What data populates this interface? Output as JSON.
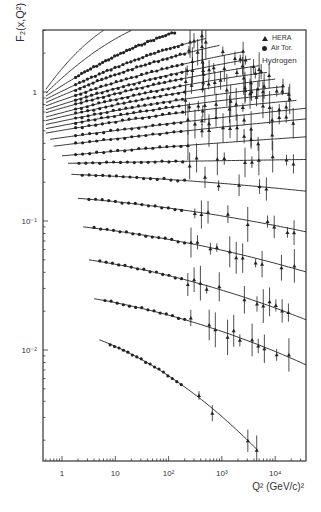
{
  "chart_data": {
    "type": "scatter",
    "title": "",
    "xlabel": "Q² (GeV/c)²",
    "ylabel": "F₂(x,Q²)",
    "xscale": "log",
    "yscale": "log",
    "xlim": [
      0.5,
      40000
    ],
    "ylim": [
      0.0017,
      3.0
    ],
    "x_ticks": [
      {
        "value": 1,
        "label": "1"
      },
      {
        "value": 10,
        "label": "10"
      },
      {
        "value": 100,
        "label": "10²"
      },
      {
        "value": 1000,
        "label": "10³"
      },
      {
        "value": 10000,
        "label": "10⁴"
      }
    ],
    "y_ticks": [
      {
        "value": 1,
        "label": "1"
      },
      {
        "value": 0.1,
        "label": "10⁻¹"
      },
      {
        "value": 0.01,
        "label": "10⁻²"
      }
    ],
    "grid": false,
    "legend": {
      "position": "upper right",
      "entries": [
        {
          "symbol": "triangle",
          "label": "HERA"
        },
        {
          "symbol": "circle",
          "label": "Air Tor."
        }
      ],
      "note": "Hydrogen"
    },
    "series_description": "Family of F2 structure function curves vs Q² at fixed x bins, data points with error bars; curves offset vertically. Values approximate, read from log axes.",
    "curves": [
      {
        "x_start": 0.5,
        "y_start": 1.05,
        "x_end": 6,
        "y_end": 3.0
      },
      {
        "x_start": 0.5,
        "y_start": 0.98,
        "x_end": 20,
        "y_end": 3.0
      },
      {
        "x_start": 0.5,
        "y_start": 0.93,
        "x_end": 130,
        "y_end": 2.9
      },
      {
        "x_start": 0.5,
        "y_start": 0.88,
        "x_end": 500,
        "y_end": 2.6
      },
      {
        "x_start": 0.5,
        "y_start": 0.83,
        "x_end": 900,
        "y_end": 2.3
      },
      {
        "x_start": 0.5,
        "y_start": 0.78,
        "x_end": 2500,
        "y_end": 2.05
      },
      {
        "x_start": 0.5,
        "y_start": 0.73,
        "x_end": 3500,
        "y_end": 1.8
      },
      {
        "x_start": 0.5,
        "y_start": 0.69,
        "x_end": 5000,
        "y_end": 1.6
      },
      {
        "x_start": 0.5,
        "y_start": 0.64,
        "x_end": 7000,
        "y_end": 1.42
      },
      {
        "x_start": 0.5,
        "y_start": 0.6,
        "x_end": 10000,
        "y_end": 1.26
      },
      {
        "x_start": 0.5,
        "y_start": 0.56,
        "x_end": 14000,
        "y_end": 1.1
      },
      {
        "x_start": 0.5,
        "y_start": 0.52,
        "x_end": 18000,
        "y_end": 0.98
      },
      {
        "x_start": 0.5,
        "y_start": 0.48,
        "x_end": 25000,
        "y_end": 0.86
      },
      {
        "x_start": 0.6,
        "y_start": 0.43,
        "x_end": 40000,
        "y_end": 0.75
      },
      {
        "x_start": 0.7,
        "y_start": 0.38,
        "x_end": 40000,
        "y_end": 0.62
      },
      {
        "x_start": 1.0,
        "y_start": 0.32,
        "x_end": 40000,
        "y_end": 0.45
      },
      {
        "x_start": 1.3,
        "y_start": 0.28,
        "x_end": 40000,
        "y_end": 0.3
      },
      {
        "x_start": 1.5,
        "y_start": 0.23,
        "x_end": 40000,
        "y_end": 0.17
      },
      {
        "x_start": 2.0,
        "y_start": 0.15,
        "x_end": 40000,
        "y_end": 0.082
      },
      {
        "x_start": 2.5,
        "y_start": 0.09,
        "x_end": 40000,
        "y_end": 0.04
      },
      {
        "x_start": 3.2,
        "y_start": 0.05,
        "x_end": 40000,
        "y_end": 0.017
      },
      {
        "x_start": 4.0,
        "y_start": 0.025,
        "x_end": 40000,
        "y_end": 0.0076
      },
      {
        "x_start": 5.0,
        "y_start": 0.012,
        "x_end": 4500,
        "y_end": 0.0017
      }
    ]
  },
  "labels": {
    "ylabel": "F₂(x,Q²)",
    "xlabel": "Q² (GeV/c)²",
    "legend_hera": "HERA",
    "legend_airtor": "Air Tor.",
    "legend_note": "Hydrogen"
  }
}
